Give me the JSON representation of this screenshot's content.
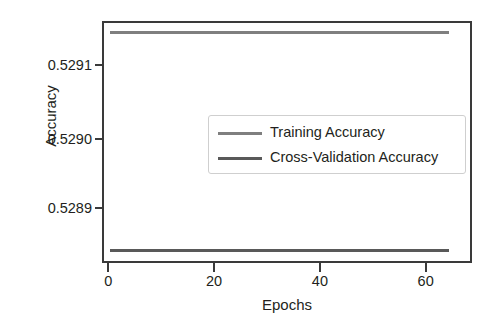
{
  "chart_data": {
    "type": "line",
    "title": "",
    "xlabel": "Epochs",
    "ylabel": "Accuracy",
    "xlim": [
      -1.2,
      68
    ],
    "ylim": [
      0.52884,
      0.529165
    ],
    "xticks": [
      0,
      20,
      40,
      60
    ],
    "xtick_labels": [
      "0",
      "20",
      "40",
      "60"
    ],
    "yticks": [
      0.5289,
      0.529,
      0.5291
    ],
    "ytick_labels": [
      "0.5289",
      "0.5290",
      "0.5291"
    ],
    "grid": false,
    "legend_position": "center",
    "x": [
      0,
      64
    ],
    "series": [
      {
        "name": "Training Accuracy",
        "color": "#7f7f7f",
        "values": [
          0.529152,
          0.529152
        ],
        "constant": true
      },
      {
        "name": "Cross-Validation Accuracy",
        "color": "#595959",
        "values": [
          0.528854,
          0.528854
        ],
        "constant": true
      }
    ]
  },
  "axes": {
    "y_label": "Accuracy",
    "x_label": "Epochs",
    "y_tick_0": "0.5291",
    "y_tick_1": "0.5290",
    "y_tick_2": "0.5289",
    "x_tick_0": "0",
    "x_tick_1": "20",
    "x_tick_2": "40",
    "x_tick_3": "60"
  },
  "legend": {
    "entries": [
      {
        "label": "Training Accuracy",
        "color": "#7f7f7f"
      },
      {
        "label": "Cross-Validation Accuracy",
        "color": "#595959"
      }
    ]
  },
  "colors": {
    "axis": "#3a3a3a",
    "text": "#231f20",
    "training_line": "#7f7f7f",
    "cross_validation_line": "#595959",
    "legend_border": "#cfcfcf",
    "background": "#ffffff"
  }
}
